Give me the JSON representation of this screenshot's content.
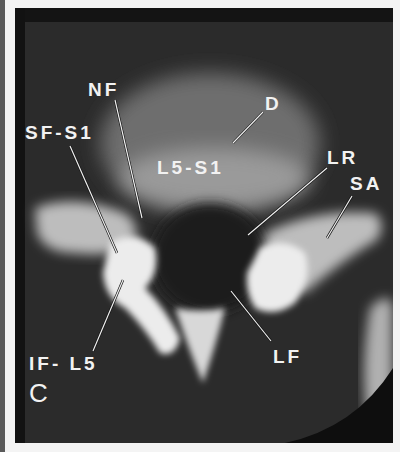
{
  "figure": {
    "panel_letter": "C",
    "labels": {
      "nf": "NF",
      "sf_s1": "SF-S1",
      "d": "D",
      "l5_s1": "L5-S1",
      "lr": "LR",
      "sa": "SA",
      "lf": "LF",
      "if_l5": "IF- L5"
    },
    "colors": {
      "background": "#2b2b2b",
      "bone": "#e8e8e8",
      "disc": "#8a8a8a",
      "label_text": "#f2f2f2",
      "border": "#f4f4f4"
    }
  }
}
